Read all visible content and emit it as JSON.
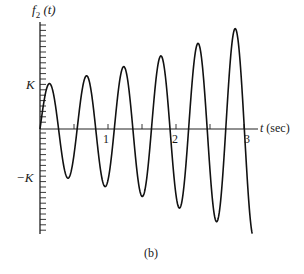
{
  "figure": {
    "caption": "(b)",
    "y_axis_label_main": "f",
    "y_axis_label_sub": "2",
    "y_axis_label_arg": "(t)",
    "x_axis_label_var": "t",
    "x_axis_label_unit": "(sec)",
    "y_tick_labels": {
      "pos": "K",
      "neg": "−K"
    },
    "x_tick_labels": [
      "1",
      "2",
      "3"
    ]
  },
  "chart_data": {
    "type": "line",
    "title": "",
    "caption": "(b)",
    "xlabel": "t (sec)",
    "ylabel": "f2(t)",
    "x_ticks": [
      1,
      2,
      3
    ],
    "x_minor_ticks": [
      0.5,
      1.5,
      2.5
    ],
    "y_tick_labels": [
      "K",
      "-K"
    ],
    "xlim": [
      0,
      3.3
    ],
    "ylim": [
      -2.3,
      2.3
    ],
    "grid": false,
    "legend": null,
    "series": [
      {
        "name": "f2(t)",
        "peaks": [
          {
            "t": 0.13,
            "y": 1.0
          },
          {
            "t": 0.66,
            "y": 1.15
          },
          {
            "t": 1.21,
            "y": 1.35
          },
          {
            "t": 1.75,
            "y": 1.6
          },
          {
            "t": 2.3,
            "y": 1.9
          },
          {
            "t": 2.85,
            "y": 2.25
          }
        ],
        "troughs": [
          {
            "t": 0.4,
            "y": -1.07
          },
          {
            "t": 0.93,
            "y": -1.25
          },
          {
            "t": 1.48,
            "y": -1.47
          },
          {
            "t": 2.03,
            "y": -1.7
          },
          {
            "t": 2.58,
            "y": -2.0
          }
        ],
        "end": {
          "t": 3.1,
          "y": -2.2
        }
      }
    ],
    "model": {
      "form": "K*exp(a*t)*sin(w*t)",
      "a": 0.29,
      "w": 11.5,
      "t_end": 3.12
    }
  }
}
